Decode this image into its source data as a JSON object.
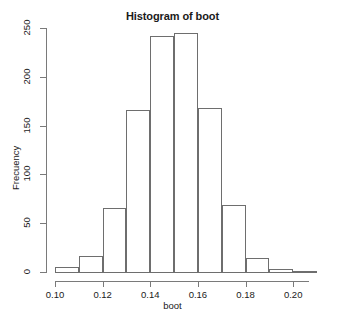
{
  "chart_data": {
    "type": "bar",
    "title": "Histogram of boot",
    "xlabel": "boot",
    "ylabel": "Frecuency",
    "grid": false,
    "legend": null,
    "xlim": [
      0.1,
      0.21
    ],
    "ylim": [
      0,
      250
    ],
    "bin_width": 0.01,
    "bin_edges": [
      0.1,
      0.11,
      0.12,
      0.13,
      0.14,
      0.15,
      0.16,
      0.17,
      0.18,
      0.19,
      0.2,
      0.21
    ],
    "categories": [
      "0.10-0.11",
      "0.11-0.12",
      "0.12-0.13",
      "0.13-0.14",
      "0.14-0.15",
      "0.15-0.16",
      "0.16-0.17",
      "0.17-0.18",
      "0.18-0.19",
      "0.19-0.20",
      "0.20-0.21"
    ],
    "values": [
      5,
      16,
      66,
      166,
      242,
      245,
      168,
      69,
      14,
      3,
      1
    ],
    "xticks": [
      0.1,
      0.12,
      0.14,
      0.16,
      0.18,
      0.2
    ],
    "xtick_labels": [
      "0.10",
      "0.12",
      "0.14",
      "0.16",
      "0.18",
      "0.20"
    ],
    "yticks": [
      0,
      50,
      100,
      150,
      200,
      250
    ],
    "ytick_labels": [
      "0",
      "50",
      "100",
      "150",
      "200",
      "250"
    ],
    "bar_fill": "#ffffff",
    "bar_border": "#6e6e6e",
    "axis_color": "#7a7a7a",
    "text_color": "#1a1a1a",
    "background": "#ffffff"
  }
}
